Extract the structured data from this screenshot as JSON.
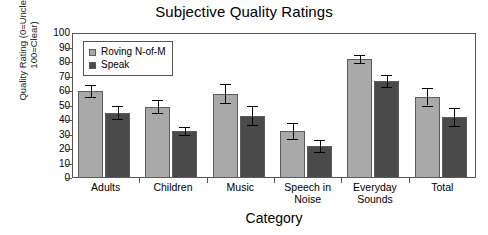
{
  "chart_data": {
    "type": "bar",
    "title": "Subjective Quality Ratings",
    "xlabel": "Category",
    "ylabel": "Quality Rating (0=Unclear, 100=Clear)",
    "ylabel_line1": "Quality Rating (0=Unclear,",
    "ylabel_line2": "100=Clear)",
    "ylim": [
      0,
      100
    ],
    "ytick_step": 10,
    "yticks": [
      100,
      90,
      80,
      70,
      60,
      50,
      40,
      30,
      20,
      10,
      0
    ],
    "grid": false,
    "legend_position": "top-left inside plot",
    "categories": [
      "Adults",
      "Children",
      "Music",
      "Speech in Noise",
      "Everyday Sounds",
      "Total"
    ],
    "category_lines": [
      [
        "Adults"
      ],
      [
        "Children"
      ],
      [
        "Music"
      ],
      [
        "Speech in",
        "Noise"
      ],
      [
        "Everyday",
        "Sounds"
      ],
      [
        "Total"
      ]
    ],
    "series": [
      {
        "name": "Roving N-of-M",
        "color": "#a9a9a9",
        "values": [
          60,
          49,
          58,
          32.5,
          82,
          56
        ],
        "errors": [
          4,
          4.5,
          6.5,
          5.5,
          3,
          6
        ]
      },
      {
        "name": "Speak",
        "color": "#4a4a4a",
        "values": [
          45,
          32.5,
          43,
          22,
          67,
          42
        ],
        "errors": [
          4.5,
          3,
          6.5,
          4,
          4,
          6
        ]
      }
    ]
  },
  "colors": {
    "series_light": "#a9a9a9",
    "series_dark": "#4a4a4a",
    "axis": "#555555",
    "text": "#000000",
    "background": "#ffffff"
  }
}
